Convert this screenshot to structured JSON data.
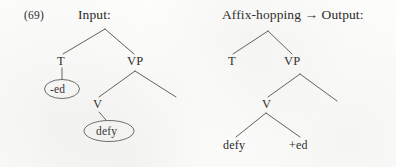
{
  "figure": {
    "example_number": "(69)",
    "background_color": "#fdfdfc",
    "ink_color": "#262524",
    "stroke_color": "#4a4846"
  },
  "panels": [
    {
      "id": "input",
      "heading": "Input:",
      "tree": {
        "root": {
          "label": "",
          "x": 105,
          "y": 28
        },
        "nodes": [
          {
            "name": "T",
            "label": "T",
            "x": 62,
            "y": 62
          },
          {
            "name": "VP",
            "label": "VP",
            "x": 135,
            "y": 62
          },
          {
            "name": "V",
            "label": "V",
            "x": 97,
            "y": 105
          }
        ],
        "terminals": [
          {
            "name": "ed-affix",
            "label": "-ed",
            "x": 62,
            "y": 89,
            "circled": true
          },
          {
            "name": "defy-verb",
            "label": "defy",
            "x": 109,
            "y": 131,
            "circled": true
          }
        ]
      }
    },
    {
      "id": "output",
      "heading": "Affix-hopping → Output:",
      "tree": {
        "root": {
          "label": "",
          "x": 268,
          "y": 30
        },
        "nodes": [
          {
            "name": "T",
            "label": "T",
            "x": 232,
            "y": 62
          },
          {
            "name": "VP",
            "label": "VP",
            "x": 292,
            "y": 62
          },
          {
            "name": "V",
            "label": "V",
            "x": 266,
            "y": 105
          }
        ],
        "terminals": [
          {
            "name": "defy-verb",
            "label": "defy",
            "x": 236,
            "y": 145,
            "circled": false
          },
          {
            "name": "ed-affix",
            "label": "+ed",
            "x": 301,
            "y": 145,
            "circled": false
          }
        ]
      }
    }
  ],
  "annotations": {
    "arrow_glyph": "→",
    "process_name": "Affix-hopping"
  }
}
